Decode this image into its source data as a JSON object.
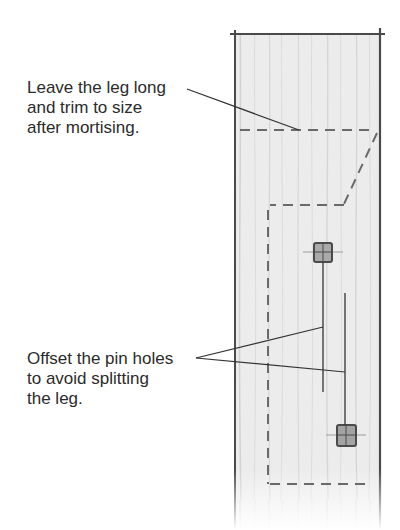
{
  "figure": {
    "callouts": [
      {
        "id": "trim-note",
        "lines": [
          "Leave the leg long",
          "and trim to size",
          "after mortising."
        ]
      },
      {
        "id": "pin-note",
        "lines": [
          "Offset the pin holes",
          "to avoid splitting",
          "the leg."
        ]
      }
    ],
    "colors": {
      "background": "#ffffff",
      "text": "#2b2b2b",
      "leg_fill": "#ececec",
      "leg_outline": "#4a4a4a",
      "dashed_lines": "#6a6a6a",
      "leader_lines": "#333333",
      "pin_hole": "#5a5a5a"
    }
  }
}
